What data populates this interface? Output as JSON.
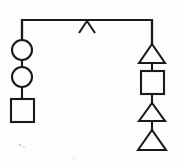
{
  "diagram": {
    "background_color": "#fdfdfd",
    "stroke_color": "#1a1a1a",
    "canvas": {
      "width": 183,
      "height": 163
    },
    "top_bus": {
      "name": "horizontal-sibship-line",
      "x_start": 22,
      "x_end": 152,
      "y": 20,
      "left_drop_to": 40,
      "right_drop_to": 44
    },
    "center_marker": {
      "name": "caret-marker",
      "glyph": "∧",
      "apex_x": 87,
      "apex_y": 21,
      "left_x": 79,
      "right_x": 95,
      "base_y": 33
    },
    "left_branch": {
      "name": "left-descent-chain",
      "axis_x": 22,
      "nodes": [
        {
          "shape": "circle",
          "label": "circle-node-1",
          "cx": 22,
          "cy": 50,
          "r": 10
        },
        {
          "shape": "circle",
          "label": "circle-node-2",
          "cx": 22,
          "cy": 77,
          "r": 10
        },
        {
          "shape": "square",
          "label": "square-node-1",
          "x": 11,
          "y": 99,
          "size": 23
        }
      ],
      "connectors": [
        {
          "from_y": 20,
          "to_y": 40
        },
        {
          "from_y": 60,
          "to_y": 67
        },
        {
          "from_y": 87,
          "to_y": 99
        }
      ]
    },
    "right_branch": {
      "name": "right-descent-chain",
      "axis_x": 152,
      "nodes": [
        {
          "shape": "triangle",
          "label": "triangle-node-1",
          "cx": 152,
          "apex_y": 44,
          "base_y": 63,
          "half_width": 13
        },
        {
          "shape": "square",
          "label": "square-node-2",
          "x": 141,
          "y": 71,
          "size": 23
        },
        {
          "shape": "triangle",
          "label": "triangle-node-2",
          "cx": 152,
          "apex_y": 103,
          "base_y": 121,
          "half_width": 13
        },
        {
          "shape": "triangle",
          "label": "triangle-node-3",
          "cx": 152,
          "apex_y": 130,
          "base_y": 150,
          "half_width": 14
        }
      ],
      "connectors": [
        {
          "from_y": 20,
          "to_y": 44
        },
        {
          "from_y": 63,
          "to_y": 71
        },
        {
          "from_y": 94,
          "to_y": 103
        },
        {
          "from_y": 121,
          "to_y": 131
        }
      ]
    },
    "artifacts": [
      {
        "name": "scan-speck-a",
        "cx": 20,
        "cy": 145,
        "r": 1.6
      },
      {
        "name": "scan-speck-b",
        "cx": 24,
        "cy": 147,
        "r": 1.1
      },
      {
        "name": "scan-speck-c",
        "cx": 74,
        "cy": 158,
        "r": 1.3
      }
    ]
  }
}
